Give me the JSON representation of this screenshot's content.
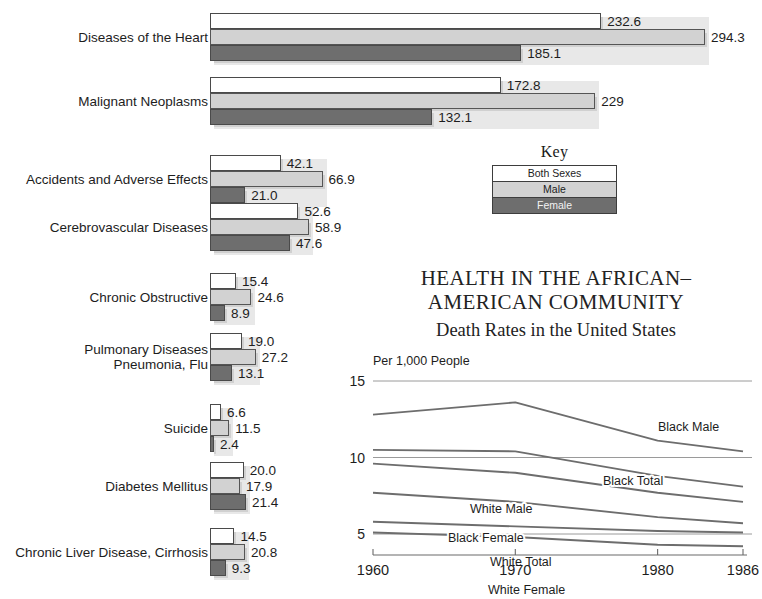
{
  "title": {
    "line1": "HEALTH IN THE AFRICAN–",
    "line2": "AMERICAN COMMUNITY",
    "line3": "Death Rates in the United States"
  },
  "key": {
    "heading": "Key",
    "items": [
      {
        "label": "Both Sexes",
        "color": "#ffffff"
      },
      {
        "label": "Male",
        "color": "#d2d2d2"
      },
      {
        "label": "Female",
        "color": "#6e6e6e"
      }
    ]
  },
  "bar_chart": {
    "type": "bar",
    "orientation": "horizontal",
    "series_names": [
      "Both Sexes",
      "Male",
      "Female"
    ],
    "max_value": 294.3,
    "categories": [
      "Diseases of the Heart",
      "Malignant Neoplasms",
      "Accidents and Adverse Effects",
      "Cerebrovascular Diseases",
      "Chronic Obstructive",
      "Pulmonary Diseases\nPneumonia, Flu",
      "Suicide",
      "Diabetes Mellitus",
      "Chronic Liver Disease, Cirrhosis"
    ],
    "groups": [
      {
        "label": "Diseases of the Heart",
        "both": 232.6,
        "male": 294.3,
        "female": 185.1,
        "both_txt": "232.6",
        "male_txt": "294.3",
        "female_txt": "185.1"
      },
      {
        "label": "Malignant Neoplasms",
        "both": 172.8,
        "male": 229.0,
        "female": 132.1,
        "both_txt": "172.8",
        "male_txt": "229",
        "female_txt": "132.1"
      },
      {
        "label": "Accidents and Adverse Effects",
        "both": 42.1,
        "male": 66.9,
        "female": 21.0,
        "both_txt": "42.1",
        "male_txt": "66.9",
        "female_txt": "21.0"
      },
      {
        "label": "Cerebrovascular Diseases",
        "both": 52.6,
        "male": 58.9,
        "female": 47.6,
        "both_txt": "52.6",
        "male_txt": "58.9",
        "female_txt": "47.6"
      },
      {
        "label": "Chronic Obstructive",
        "both": 15.4,
        "male": 24.6,
        "female": 8.9,
        "both_txt": "15.4",
        "male_txt": "24.6",
        "female_txt": "8.9"
      },
      {
        "label": "Pulmonary Diseases\nPneumonia, Flu",
        "both": 19.0,
        "male": 27.2,
        "female": 13.1,
        "both_txt": "19.0",
        "male_txt": "27.2",
        "female_txt": "13.1"
      },
      {
        "label": "Suicide",
        "both": 6.6,
        "male": 11.5,
        "female": 2.4,
        "both_txt": "6.6",
        "male_txt": "11.5",
        "female_txt": "2.4"
      },
      {
        "label": "Diabetes Mellitus",
        "both": 20.0,
        "male": 17.9,
        "female": 21.4,
        "both_txt": "20.0",
        "male_txt": "17.9",
        "female_txt": "21.4"
      },
      {
        "label": "Chronic Liver Disease, Cirrhosis",
        "both": 14.5,
        "male": 20.8,
        "female": 9.3,
        "both_txt": "14.5",
        "male_txt": "20.8",
        "female_txt": "9.3"
      }
    ]
  },
  "line_chart": {
    "type": "line",
    "caption": "Per 1,000 People",
    "ylabel": "Per 1,000 People",
    "xlabel": "",
    "x": [
      1960,
      1970,
      1980,
      1986
    ],
    "xtick_labels": [
      "1960",
      "1970",
      "1980",
      "1986"
    ],
    "ytick_labels": [
      "15",
      "10",
      "5"
    ],
    "yticks": [
      15,
      10,
      5
    ],
    "ylim": [
      3.6,
      15.8
    ],
    "grid": true,
    "legend_position": "inline-labels",
    "series": [
      {
        "name": "Black Male",
        "label": "Black Male",
        "values": [
          12.8,
          13.6,
          11.1,
          10.4
        ]
      },
      {
        "name": "Black Total",
        "label": "Black Total",
        "values": [
          10.5,
          10.4,
          8.8,
          8.1
        ]
      },
      {
        "name": "White Male",
        "label": "White Male",
        "values": [
          9.6,
          9.0,
          7.7,
          7.1
        ]
      },
      {
        "name": "Black Female",
        "label": "Black Female",
        "values": [
          7.7,
          7.1,
          6.1,
          5.7
        ]
      },
      {
        "name": "White Total",
        "label": "White Total",
        "values": [
          5.8,
          5.5,
          5.2,
          5.1
        ]
      },
      {
        "name": "White Female",
        "label": "White Female",
        "values": [
          5.1,
          4.8,
          4.3,
          4.2
        ]
      }
    ]
  }
}
